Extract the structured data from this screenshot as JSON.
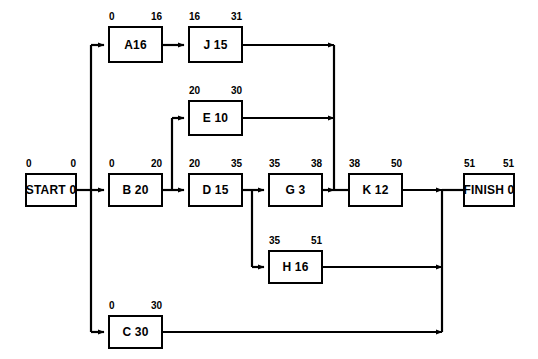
{
  "diagram": {
    "type": "project-network-activity-on-node",
    "nodes": [
      {
        "id": "start",
        "label": "START 0",
        "early_start": "0",
        "early_finish": "0",
        "x": 25,
        "y": 173,
        "w": 52,
        "h": 34
      },
      {
        "id": "a",
        "label": "A16",
        "early_start": "0",
        "early_finish": "16",
        "x": 108,
        "y": 26,
        "w": 55,
        "h": 37
      },
      {
        "id": "j",
        "label": "J 15",
        "early_start": "16",
        "early_finish": "31",
        "x": 188,
        "y": 26,
        "w": 55,
        "h": 37
      },
      {
        "id": "e",
        "label": "E 10",
        "early_start": "20",
        "early_finish": "30",
        "x": 188,
        "y": 100,
        "w": 55,
        "h": 36
      },
      {
        "id": "b",
        "label": "B 20",
        "early_start": "0",
        "early_finish": "20",
        "x": 108,
        "y": 173,
        "w": 55,
        "h": 34
      },
      {
        "id": "d",
        "label": "D 15",
        "early_start": "20",
        "early_finish": "35",
        "x": 188,
        "y": 173,
        "w": 55,
        "h": 34
      },
      {
        "id": "g",
        "label": "G 3",
        "early_start": "35",
        "early_finish": "38",
        "x": 268,
        "y": 173,
        "w": 55,
        "h": 34
      },
      {
        "id": "k",
        "label": "K 12",
        "early_start": "38",
        "early_finish": "50",
        "x": 348,
        "y": 173,
        "w": 55,
        "h": 34
      },
      {
        "id": "finish",
        "label": "FINISH 0",
        "early_start": "51",
        "early_finish": "51",
        "x": 463,
        "y": 173,
        "w": 52,
        "h": 34
      },
      {
        "id": "h",
        "label": "H 16",
        "early_start": "35",
        "early_finish": "51",
        "x": 268,
        "y": 250,
        "w": 55,
        "h": 34
      },
      {
        "id": "c",
        "label": "C 30",
        "early_start": "0",
        "early_finish": "30",
        "x": 108,
        "y": 315,
        "w": 55,
        "h": 34
      }
    ],
    "edges": [
      {
        "from": "start",
        "to": "a"
      },
      {
        "from": "start",
        "to": "b"
      },
      {
        "from": "start",
        "to": "c"
      },
      {
        "from": "a",
        "to": "j"
      },
      {
        "from": "j",
        "to": "k"
      },
      {
        "from": "b",
        "to": "e"
      },
      {
        "from": "b",
        "to": "d"
      },
      {
        "from": "e",
        "to": "k"
      },
      {
        "from": "d",
        "to": "g"
      },
      {
        "from": "d",
        "to": "h"
      },
      {
        "from": "g",
        "to": "k"
      },
      {
        "from": "k",
        "to": "finish"
      },
      {
        "from": "h",
        "to": "finish"
      },
      {
        "from": "c",
        "to": "finish"
      }
    ],
    "colors": {
      "line": "#000000",
      "box_border": "#000000",
      "box_fill": "#ffffff",
      "background": "#ffffff",
      "text": "#000000"
    }
  }
}
